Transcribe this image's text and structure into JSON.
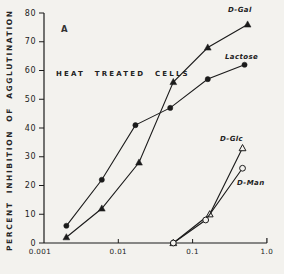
{
  "figure": {
    "panel_label": "A",
    "note": "HEAT TREATED CELLS"
  },
  "chart_data": {
    "type": "line",
    "title": "",
    "xlabel": "",
    "ylabel": "PERCENT INHIBITION OF AGGLUTINATION",
    "x_scale": "log",
    "xlim": [
      0.001,
      1.0
    ],
    "ylim": [
      0,
      80
    ],
    "x_tick_labels": [
      "0.001",
      "0.01",
      "0.1",
      "1.0"
    ],
    "x_tick_values": [
      0.001,
      0.01,
      0.1,
      1.0
    ],
    "y_ticks": [
      0,
      10,
      20,
      30,
      40,
      50,
      60,
      70,
      80
    ],
    "grid": false,
    "legend_position": "inline-labels",
    "annotations": [
      "A",
      "HEAT TREATED CELLS"
    ],
    "line_color": "#1b1b1b",
    "series": [
      {
        "name": "D-Gal",
        "marker": "filled-triangle",
        "points": [
          [
            0.002,
            2
          ],
          [
            0.006,
            12
          ],
          [
            0.019,
            28
          ],
          [
            0.055,
            56
          ],
          [
            0.16,
            68
          ],
          [
            0.55,
            76
          ]
        ]
      },
      {
        "name": "Lactose",
        "marker": "filled-circle",
        "points": [
          [
            0.002,
            6
          ],
          [
            0.006,
            22
          ],
          [
            0.017,
            41
          ],
          [
            0.05,
            47
          ],
          [
            0.16,
            57
          ],
          [
            0.5,
            62
          ]
        ]
      },
      {
        "name": "D-Glc",
        "marker": "open-triangle",
        "points": [
          [
            0.055,
            0
          ],
          [
            0.17,
            10
          ],
          [
            0.47,
            33
          ]
        ]
      },
      {
        "name": "D-Man",
        "marker": "open-circle",
        "points": [
          [
            0.055,
            0
          ],
          [
            0.15,
            8
          ],
          [
            0.47,
            26
          ]
        ]
      }
    ]
  }
}
